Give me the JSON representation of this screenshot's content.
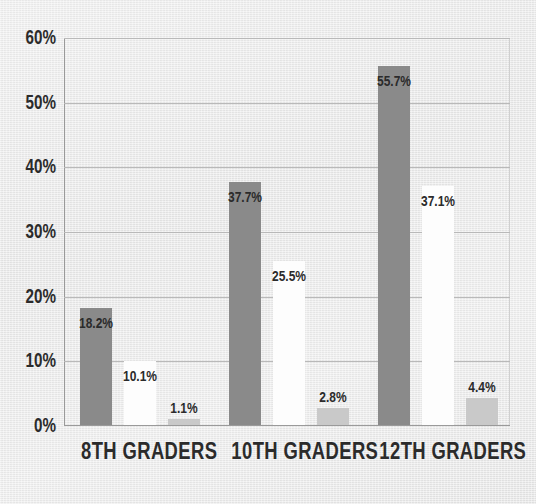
{
  "chart_data": {
    "type": "bar",
    "title": "",
    "subtitle": "",
    "xlabel": "",
    "ylabel": "",
    "categories": [
      "8TH GRADERS",
      "10TH GRADERS",
      "12TH GRADERS"
    ],
    "series": [
      {
        "name": "series-1",
        "color": "#8a8a8a",
        "values": [
          18.2,
          25.5,
          55.7
        ],
        "labels": [
          "18.2%",
          "37.7%",
          "55.7%"
        ]
      },
      {
        "name": "series-2",
        "color": "#fdfdfd",
        "values": [
          10.1,
          25.5,
          37.1
        ],
        "labels": [
          "10.1%",
          "25.5%",
          "37.1%"
        ]
      },
      {
        "name": "series-3",
        "color": "#c9c9c9",
        "values": [
          1.1,
          2.8,
          4.4
        ],
        "labels": [
          "1.1%",
          "2.8%",
          "4.4%"
        ]
      }
    ],
    "groups": [
      {
        "category": "8TH GRADERS",
        "bars": [
          {
            "label": "18.2%",
            "value": 18.2,
            "color": "#8a8a8a",
            "label_position": "inside"
          },
          {
            "label": "10.1%",
            "value": 10.1,
            "color": "#fdfdfd",
            "label_position": "inside"
          },
          {
            "label": "1.1%",
            "value": 1.1,
            "color": "#c9c9c9",
            "label_position": "above"
          }
        ]
      },
      {
        "category": "10TH GRADERS",
        "bars": [
          {
            "label": "37.7%",
            "value": 37.7,
            "color": "#8a8a8a",
            "label_position": "inside"
          },
          {
            "label": "25.5%",
            "value": 25.5,
            "color": "#fdfdfd",
            "label_position": "inside"
          },
          {
            "label": "2.8%",
            "value": 2.8,
            "color": "#c9c9c9",
            "label_position": "above"
          }
        ]
      },
      {
        "category": "12TH GRADERS",
        "bars": [
          {
            "label": "55.7%",
            "value": 55.7,
            "color": "#8a8a8a",
            "label_position": "inside"
          },
          {
            "label": "37.1%",
            "value": 37.1,
            "color": "#fdfdfd",
            "label_position": "inside"
          },
          {
            "label": "4.4%",
            "value": 4.4,
            "color": "#c9c9c9",
            "label_position": "above"
          }
        ]
      }
    ],
    "yticks": [
      "0%",
      "10%",
      "20%",
      "30%",
      "40%",
      "50%",
      "60%"
    ],
    "ytick_values": [
      0,
      10,
      20,
      30,
      40,
      50,
      60
    ],
    "ylim": [
      0,
      60
    ],
    "grid": true,
    "legend": "none",
    "background_color": "#e9e9e9",
    "gridline_color": "#b9b9b9",
    "axis_color": "#9a9a9a",
    "text_color": "#2b2b2b"
  }
}
